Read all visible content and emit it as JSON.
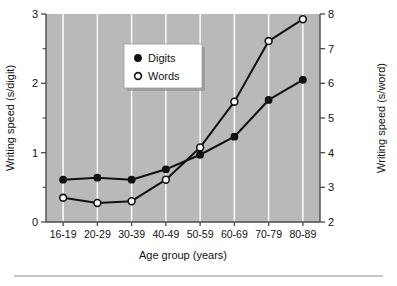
{
  "chart_data": {
    "type": "line",
    "title": "",
    "xlabel": "Age group (years)",
    "ylabel": "Writing speed (s/digit)",
    "y2label": "Writing speed (s/word)",
    "categories": [
      "16-19",
      "20-29",
      "30-39",
      "40-49",
      "50-59",
      "60-69",
      "70-79",
      "80-89"
    ],
    "ylim": [
      0,
      3
    ],
    "yticks": [
      0,
      1,
      2,
      3
    ],
    "yticklabels": [
      "0",
      "1",
      "2",
      "3"
    ],
    "yminorticks": [
      0.5,
      1.5,
      2.5
    ],
    "y2lim": [
      2,
      8
    ],
    "y2ticks": [
      2,
      3,
      4,
      5,
      6,
      7,
      8
    ],
    "y2ticklabels": [
      "2",
      "3",
      "4",
      "5",
      "6",
      "7",
      "8"
    ],
    "grid": "vertical",
    "legend_position": "upper-left-inside",
    "series": [
      {
        "name": "Digits",
        "axis": "left",
        "marker": "filled-circle",
        "values": [
          0.61,
          0.64,
          0.61,
          0.76,
          0.97,
          1.23,
          1.76,
          2.05
        ]
      },
      {
        "name": "Words",
        "axis": "right",
        "marker": "open-circle",
        "values": [
          2.7,
          2.55,
          2.6,
          3.22,
          4.15,
          5.47,
          7.22,
          7.85
        ]
      }
    ]
  },
  "legend": {
    "items": [
      {
        "label": "Digits",
        "marker": "filled-circle"
      },
      {
        "label": "Words",
        "marker": "open-circle"
      }
    ]
  },
  "colors": {
    "plot_background": "#b9b9b9",
    "gridline": "#ffffff",
    "series": "#111111",
    "axis": "#4a4a4a",
    "page_background": "#ffffff"
  }
}
